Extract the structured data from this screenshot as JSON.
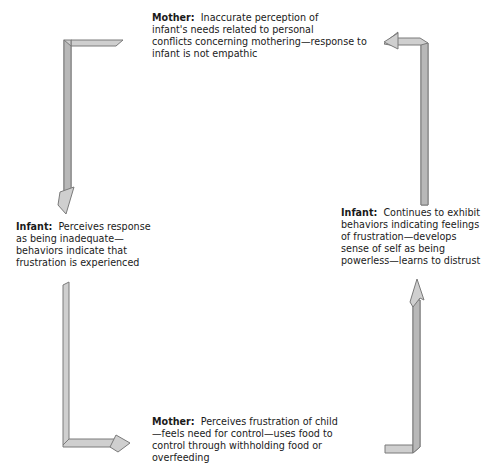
{
  "diagram": {
    "type": "cycle",
    "direction": "counterclockwise",
    "arrow_color": "#c9c9c9",
    "arrow_stroke": "#7a7a7a",
    "nodes": [
      {
        "id": "top",
        "role": "Mother:",
        "text": "Inaccurate perception of infant's needs related to personal conflicts concerning mothering—response to infant is not empathic",
        "lines": [
          "Inaccurate perception of",
          "infant's needs related to personal",
          "conflicts concerning mothering—response to",
          "infant is not empathic"
        ]
      },
      {
        "id": "left",
        "role": "Infant:",
        "text": "Perceives response as being inadequate—behaviors indicate that frustration is experienced",
        "lines": [
          "Perceives response",
          "as being inadequate—",
          "behaviors indicate that",
          "frustration is experienced"
        ]
      },
      {
        "id": "bottom",
        "role": "Mother:",
        "text": "Perceives frustration of child—feels need for control—uses food to control through withholding food or overfeeding",
        "lines": [
          "Perceives frustration of child",
          "—feels need for control—uses food to",
          "control through withholding food or",
          "overfeeding"
        ]
      },
      {
        "id": "right",
        "role": "Infant:",
        "text": "Continues to exhibit behaviors indicating feelings of frustration—develops sense of self as being powerless—learns to distrust",
        "lines": [
          "Continues to exhibit",
          "behaviors indicating feelings",
          "of frustration—develops",
          "sense of self as being",
          "powerless—learns to distrust"
        ]
      }
    ],
    "edges": [
      {
        "from": "top",
        "to": "left"
      },
      {
        "from": "left",
        "to": "bottom"
      },
      {
        "from": "bottom",
        "to": "right"
      },
      {
        "from": "right",
        "to": "top"
      }
    ]
  }
}
